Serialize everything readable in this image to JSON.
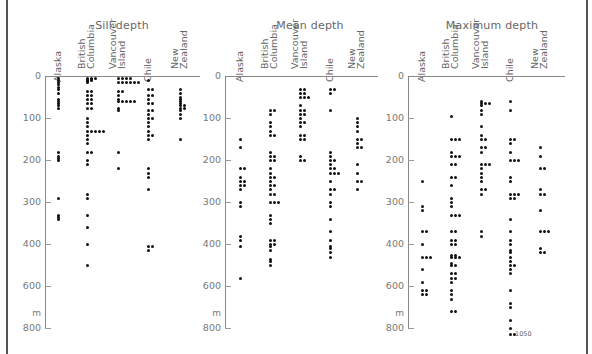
{
  "chart_data": [
    {
      "type": "scatter",
      "title": "Sill depth",
      "xlabel": "",
      "ylabel": "m",
      "y_axis_ticks": [
        0,
        100,
        200,
        300,
        400,
        600,
        800
      ],
      "y_axis_note": "y-axis is linear 0-400 and compressed 400-800 (inverted, depth increases downward)",
      "ylim": [
        0,
        800
      ],
      "grid": false,
      "categories": [
        "Alaska",
        "British Columbia",
        "Vancouver Island",
        "Chile",
        "New Zealand"
      ],
      "series": [
        {
          "name": "Alaska",
          "values": [
            5,
            10,
            15,
            20,
            25,
            30,
            40,
            55,
            60,
            65,
            70,
            75,
            180,
            190,
            195,
            200,
            290,
            330,
            335,
            340
          ]
        },
        {
          "name": "British Columbia",
          "values": [
            5,
            5,
            8,
            10,
            12,
            15,
            10,
            8,
            5,
            35,
            35,
            45,
            45,
            55,
            55,
            65,
            65,
            75,
            75,
            100,
            110,
            120,
            130,
            130,
            130,
            130,
            130,
            140,
            150,
            160,
            180,
            180,
            200,
            210,
            280,
            290,
            330,
            360,
            400,
            500
          ]
        },
        {
          "name": "Vancouver Island",
          "values": [
            5,
            5,
            5,
            5,
            15,
            15,
            15,
            15,
            15,
            15,
            35,
            35,
            45,
            55,
            60,
            60,
            60,
            60,
            60,
            75,
            80,
            180,
            220
          ]
        },
        {
          "name": "Chile",
          "values": [
            10,
            30,
            30,
            45,
            45,
            55,
            65,
            65,
            80,
            80,
            90,
            100,
            100,
            110,
            120,
            130,
            140,
            140,
            150,
            220,
            230,
            240,
            270,
            410,
            410,
            430
          ]
        },
        {
          "name": "New Zealand",
          "values": [
            30,
            40,
            50,
            55,
            60,
            65,
            70,
            70,
            75,
            75,
            80,
            90,
            100,
            150
          ]
        }
      ]
    },
    {
      "type": "scatter",
      "title": "Mean depth",
      "xlabel": "",
      "ylabel": "m",
      "y_axis_ticks": [
        0,
        100,
        200,
        300,
        400,
        600,
        800
      ],
      "ylim": [
        0,
        800
      ],
      "grid": false,
      "categories": [
        "Alaska",
        "British Columbia",
        "Vancouver Island",
        "Chile",
        "New Zealand"
      ],
      "series": [
        {
          "name": "Alaska",
          "values": [
            150,
            170,
            220,
            220,
            240,
            250,
            250,
            260,
            260,
            270,
            300,
            310,
            380,
            390,
            410,
            560
          ]
        },
        {
          "name": "British Columbia",
          "values": [
            80,
            80,
            90,
            110,
            120,
            130,
            140,
            140,
            180,
            190,
            190,
            200,
            200,
            220,
            230,
            240,
            240,
            250,
            260,
            260,
            270,
            280,
            280,
            300,
            300,
            300,
            330,
            340,
            350,
            390,
            390,
            400,
            400,
            410,
            430,
            470,
            480,
            500
          ]
        },
        {
          "name": "Vancouver Island",
          "values": [
            30,
            30,
            40,
            40,
            50,
            50,
            50,
            70,
            80,
            80,
            90,
            90,
            100,
            110,
            110,
            120,
            140,
            140,
            150,
            150,
            190,
            200,
            200
          ]
        },
        {
          "name": "Chile",
          "values": [
            30,
            30,
            40,
            80,
            180,
            190,
            200,
            200,
            210,
            220,
            220,
            230,
            230,
            230,
            250,
            270,
            270,
            280,
            300,
            310,
            340,
            370,
            390,
            410,
            420,
            440,
            460
          ]
        },
        {
          "name": "New Zealand",
          "values": [
            100,
            110,
            120,
            130,
            150,
            150,
            160,
            170,
            170,
            210,
            230,
            250,
            250,
            270
          ]
        }
      ]
    },
    {
      "type": "scatter",
      "title": "Maximum depth",
      "xlabel": "",
      "ylabel": "m",
      "y_axis_ticks": [
        0,
        100,
        200,
        300,
        400,
        600,
        800
      ],
      "ylim": [
        0,
        800
      ],
      "grid": false,
      "categories": [
        "Alaska",
        "British Columbia",
        "Vancouver Island",
        "Chile",
        "New Zealand"
      ],
      "series": [
        {
          "name": "Alaska",
          "values": [
            250,
            310,
            320,
            370,
            370,
            400,
            460,
            460,
            460,
            520,
            580,
            620,
            620,
            640,
            640
          ]
        },
        {
          "name": "British Columbia",
          "values": [
            95,
            150,
            150,
            150,
            180,
            190,
            190,
            190,
            210,
            210,
            240,
            240,
            260,
            290,
            300,
            310,
            330,
            330,
            330,
            370,
            370,
            390,
            390,
            400,
            400,
            450,
            450,
            460,
            460,
            460,
            490,
            500,
            500,
            540,
            540,
            560,
            560,
            580,
            620,
            640,
            660,
            720,
            720
          ]
        },
        {
          "name": "Vancouver Island",
          "values": [
            60,
            65,
            65,
            65,
            70,
            80,
            90,
            120,
            140,
            150,
            150,
            170,
            170,
            180,
            210,
            210,
            210,
            220,
            230,
            240,
            250,
            270,
            270,
            280,
            370,
            380
          ]
        },
        {
          "name": "Chile",
          "values": [
            60,
            80,
            150,
            150,
            160,
            180,
            200,
            200,
            200,
            240,
            250,
            280,
            280,
            280,
            290,
            290,
            340,
            370,
            390,
            400,
            430,
            440,
            460,
            480,
            500,
            500,
            520,
            540,
            620,
            680,
            700,
            760,
            800,
            820,
            1050
          ]
        },
        {
          "name": "New Zealand",
          "values": [
            170,
            190,
            220,
            220,
            270,
            280,
            280,
            320,
            370,
            370,
            370,
            420,
            440,
            440
          ]
        }
      ],
      "annotations": [
        {
          "text": "1050",
          "note": "off-scale Chile value marked at bottom"
        }
      ]
    }
  ],
  "panels": [
    {
      "title": "Sill depth",
      "columns": [
        "Alaska",
        "British\nColumbia",
        "Vancouver\nIsland",
        "Chile",
        "New\nZealand"
      ]
    },
    {
      "title": "Mean depth",
      "columns": [
        "Alaska",
        "British\nColumbia",
        "Vancouver\nIsland",
        "Chile",
        "New\nZealand"
      ]
    },
    {
      "title": "Maximum depth",
      "columns": [
        "Alaska",
        "British\nColumbia",
        "Vancouver\nIsland",
        "Chile",
        "New\nZealand"
      ]
    }
  ],
  "axis": {
    "ticks": [
      "0",
      "100",
      "200",
      "300",
      "400",
      "600",
      "800"
    ],
    "unit": "m"
  },
  "annotation_1050": "1050",
  "colors": {
    "dot": "#111111",
    "axis": "#888888",
    "text": "#666666"
  }
}
